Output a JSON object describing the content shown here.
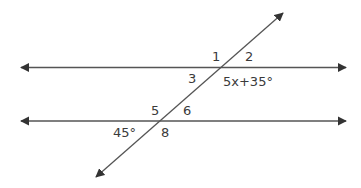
{
  "diagram": {
    "type": "parallel-lines-transversal",
    "line_color": "#555555",
    "label_color": "#3a3a3a",
    "lines": [
      {
        "name": "upper-parallel-line",
        "x1": 21,
        "y1": 67.5,
        "x2": 346,
        "y2": 67.5,
        "arrows": "both"
      },
      {
        "name": "lower-parallel-line",
        "x1": 21,
        "y1": 121,
        "x2": 346,
        "y2": 121,
        "arrows": "both"
      },
      {
        "name": "transversal",
        "x1": 96,
        "y1": 177,
        "x2": 283,
        "y2": 13,
        "arrows": "both"
      }
    ],
    "labels": {
      "angle1": "1",
      "angle2": "2",
      "angle3": "3",
      "angle3_expr": "5x+35°",
      "angle5": "5",
      "angle6": "6",
      "angle8": "8",
      "angle7_value": "45°"
    }
  }
}
